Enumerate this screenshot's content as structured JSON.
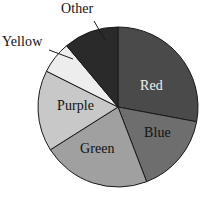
{
  "chart_data": {
    "type": "pie",
    "title": "",
    "subtitle": "",
    "xlabel": "",
    "ylabel": "",
    "grid": false,
    "legend_position": "none",
    "label_placement": "inside-slices-with-callouts",
    "center": {
      "x": 118,
      "y": 107
    },
    "radius": 80,
    "start_angle_deg": 0,
    "direction": "clockwise",
    "outline_color": "#1a1a1a",
    "categories": [
      "Red",
      "Blue",
      "Green",
      "Purple",
      "Yellow",
      "Other"
    ],
    "values": [
      28.0,
      16.2,
      21.9,
      16.4,
      6.5,
      11.0
    ],
    "units": "percent",
    "slices": [
      {
        "label": "Red",
        "value": 28.0,
        "start_angle_deg": 0.0,
        "end_angle_deg": 100.6,
        "fill": "#4a4a4a",
        "label_placement": "inside",
        "label_color": "#f2f2f2"
      },
      {
        "label": "Blue",
        "value": 16.2,
        "start_angle_deg": 100.6,
        "end_angle_deg": 159.0,
        "fill": "#6e6e6e",
        "label_placement": "inside",
        "label_color": "#121212"
      },
      {
        "label": "Green",
        "value": 21.9,
        "start_angle_deg": 159.0,
        "end_angle_deg": 237.7,
        "fill": "#a0a0a0",
        "label_placement": "inside",
        "label_color": "#121212"
      },
      {
        "label": "Purple",
        "value": 16.4,
        "start_angle_deg": 237.7,
        "end_angle_deg": 296.6,
        "fill": "#c8c8c8",
        "label_placement": "inside",
        "label_color": "#121212"
      },
      {
        "label": "Yellow",
        "value": 6.5,
        "start_angle_deg": 296.6,
        "end_angle_deg": 320.0,
        "fill": "#ededed",
        "label_placement": "callout",
        "label_color": "#121212"
      },
      {
        "label": "Other",
        "value": 11.0,
        "start_angle_deg": 320.0,
        "end_angle_deg": 360.0,
        "fill": "#2a2a2a",
        "label_placement": "callout",
        "label_color": "#121212"
      }
    ],
    "callouts": [
      {
        "label": "Other",
        "from": {
          "x": 94,
          "y": 21
        },
        "to": {
          "x": 105,
          "y": 40
        }
      },
      {
        "label": "Yellow",
        "from": {
          "x": 49,
          "y": 50
        },
        "to": {
          "x": 73,
          "y": 59
        }
      }
    ]
  },
  "labels": {
    "red": "Red",
    "blue": "Blue",
    "green": "Green",
    "purple": "Purple",
    "yellow": "Yellow",
    "other": "Other"
  }
}
